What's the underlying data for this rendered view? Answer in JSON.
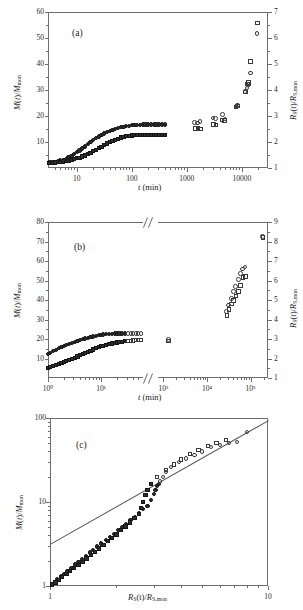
{
  "figure": {
    "panels": [
      {
        "tag": "(a)",
        "xlabel": "t (min)",
        "ylabel_left": "M(t)/Mmon",
        "ylabel_right": "RS(t)/RS,mon",
        "xticks": [
          "10",
          "100",
          "1000",
          "10000"
        ],
        "yticks_left": [
          "10",
          "20",
          "30",
          "40",
          "50",
          "60"
        ],
        "yticks_right": [
          "1",
          "2",
          "3",
          "4",
          "5",
          "6",
          "7"
        ]
      },
      {
        "tag": "(b)",
        "xlabel": "t (min)",
        "ylabel_left": "M(t)/Mmon",
        "ylabel_right": "RS(t)/RS,mon",
        "xticks": [
          "10⁰",
          "10¹",
          "10³",
          "10⁴",
          "10⁵"
        ],
        "yticks_left": [
          "10",
          "20",
          "30",
          "40",
          "50",
          "60",
          "70",
          "80"
        ],
        "yticks_right": [
          "1",
          "2",
          "3",
          "4",
          "5",
          "6",
          "7",
          "8",
          "9"
        ]
      },
      {
        "tag": "(c)",
        "xlabel": "RS(t)/RS,mon",
        "ylabel_left": "M(t)/Mmon",
        "xticks": [
          "1",
          "10"
        ],
        "yticks_left": [
          "1",
          "10",
          "100"
        ]
      }
    ]
  },
  "chart_data": [
    {
      "type": "scatter",
      "title": "(a)",
      "xlabel": "t (min)",
      "ylabel": "M(t)/M_mon",
      "ylabel_right": "R_S(t)/R_S,mon",
      "xscale": "log",
      "xlim": [
        3,
        30000
      ],
      "ylim": [
        0,
        60
      ],
      "ylim_right": [
        1,
        7
      ],
      "grid": false,
      "series": [
        {
          "name": "M(t)/M_mon (circles)",
          "marker": "circle",
          "axis": "left",
          "x": [
            3.2,
            3.6,
            4.0,
            4.5,
            5.0,
            5.6,
            6.3,
            7.1,
            8.0,
            9.0,
            10,
            11.2,
            12.6,
            14.1,
            15.8,
            17.8,
            20,
            22.4,
            25.1,
            28.2,
            31.6,
            35.5,
            39.8,
            44.7,
            50.1,
            56.2,
            63.1,
            70.8,
            79.4,
            89.1,
            100,
            112,
            126,
            141,
            158,
            178,
            200,
            224,
            251,
            282,
            316,
            355,
            398
          ],
          "y": [
            2.1,
            2.2,
            2.4,
            2.6,
            2.9,
            3.2,
            3.6,
            4.1,
            4.7,
            5.3,
            6.0,
            6.7,
            7.5,
            8.3,
            9.1,
            9.9,
            10.7,
            11.4,
            12.1,
            12.7,
            13.3,
            13.8,
            14.3,
            14.7,
            15.1,
            15.4,
            15.7,
            15.9,
            16.1,
            16.3,
            16.4,
            16.5,
            16.6,
            16.6,
            16.7,
            16.7,
            16.7,
            16.7,
            16.7,
            16.7,
            16.7,
            16.7,
            16.7
          ]
        },
        {
          "name": "R_S(t)/R_S,mon (squares)",
          "marker": "square",
          "axis": "left",
          "x": [
            3.2,
            3.6,
            4.0,
            4.5,
            5.0,
            5.6,
            6.3,
            7.1,
            8.0,
            9.0,
            10,
            11.2,
            12.6,
            14.1,
            15.8,
            17.8,
            20,
            22.4,
            25.1,
            28.2,
            31.6,
            35.5,
            39.8,
            44.7,
            50.1,
            56.2,
            63.1,
            70.8,
            79.4,
            89.1,
            100,
            112,
            126,
            141,
            158,
            178,
            200,
            224,
            251,
            282,
            316,
            355,
            398
          ],
          "y": [
            1.9,
            2.0,
            2.1,
            2.2,
            2.3,
            2.5,
            2.7,
            2.9,
            3.1,
            3.4,
            3.7,
            4.0,
            4.4,
            4.8,
            5.3,
            5.8,
            6.4,
            7.0,
            7.6,
            8.2,
            8.8,
            9.4,
            9.9,
            10.4,
            10.9,
            11.3,
            11.7,
            12.0,
            12.2,
            12.4,
            12.5,
            12.6,
            12.7,
            12.7,
            12.7,
            12.7,
            12.7,
            12.7,
            12.7,
            12.7,
            12.7,
            12.7,
            12.7
          ]
        },
        {
          "name": "long-time circles",
          "marker": "circle",
          "axis": "left",
          "x": [
            1400,
            1550,
            1750,
            3000,
            3300,
            4500,
            5000,
            7800,
            8300,
            11500,
            12500,
            13500,
            14500,
            19000
          ],
          "y": [
            17.5,
            17.3,
            17.8,
            19.2,
            19.0,
            20.6,
            18.8,
            23.8,
            24.2,
            29.5,
            30.8,
            32.2,
            36.5,
            51.8
          ]
        },
        {
          "name": "long-time squares",
          "marker": "square",
          "axis": "left",
          "x": [
            1450,
            1600,
            1800,
            3050,
            3400,
            4400,
            4900,
            7900,
            8400,
            11600,
            12600,
            13400,
            14400,
            19200
          ],
          "y": [
            15.3,
            15.1,
            15.0,
            16.8,
            16.6,
            18.5,
            18.3,
            23.5,
            23.9,
            29.2,
            32.3,
            32.8,
            41.0,
            55.8
          ]
        }
      ]
    },
    {
      "type": "scatter",
      "title": "(b)",
      "xlabel": "t (min)",
      "ylabel": "M(t)/M_mon",
      "ylabel_right": "R_S(t)/R_S,mon",
      "xscale": "log",
      "axis_break": true,
      "xlim_left": [
        1,
        60
      ],
      "xlim_right": [
        800,
        250000
      ],
      "ylim": [
        0,
        80
      ],
      "ylim_right": [
        1,
        9
      ],
      "grid": false,
      "series": [
        {
          "name": "circles (short time)",
          "marker": "circle",
          "x": [
            1.0,
            1.1,
            1.25,
            1.4,
            1.6,
            1.8,
            2.0,
            2.2,
            2.5,
            2.8,
            3.2,
            3.6,
            4.0,
            4.5,
            5.0,
            5.6,
            6.3,
            7.1,
            8.0,
            9.0,
            10,
            11,
            12.5,
            14,
            16,
            18,
            20,
            22,
            25,
            28,
            32,
            36,
            40,
            45,
            50,
            56
          ],
          "y": [
            12.3,
            13.0,
            13.8,
            14.5,
            15.2,
            15.8,
            16.4,
            16.9,
            17.5,
            18.0,
            18.5,
            19.0,
            19.5,
            19.9,
            20.3,
            20.7,
            21.0,
            21.3,
            21.6,
            21.9,
            22.1,
            22.3,
            22.5,
            22.6,
            22.7,
            22.8,
            22.8,
            22.8,
            22.8,
            22.8,
            22.8,
            22.8,
            22.8,
            22.8,
            22.8,
            22.8
          ]
        },
        {
          "name": "squares (short time)",
          "marker": "square",
          "x": [
            1.0,
            1.1,
            1.25,
            1.4,
            1.6,
            1.8,
            2.0,
            2.2,
            2.5,
            2.8,
            3.2,
            3.6,
            4.0,
            4.5,
            5.0,
            5.6,
            6.3,
            7.1,
            8.0,
            9.0,
            10,
            11,
            12.5,
            14,
            16,
            18,
            20,
            22,
            25,
            28,
            32,
            36,
            40,
            45,
            50,
            56
          ],
          "y": [
            5.2,
            5.6,
            6.1,
            6.6,
            7.1,
            7.6,
            8.1,
            8.6,
            9.2,
            9.8,
            10.4,
            11.0,
            11.6,
            12.2,
            12.8,
            13.4,
            14.0,
            14.6,
            15.2,
            15.7,
            16.2,
            16.6,
            17.0,
            17.4,
            17.7,
            18.0,
            18.2,
            18.4,
            18.6,
            18.8,
            19.0,
            19.1,
            19.2,
            19.3,
            19.4,
            19.4
          ]
        },
        {
          "name": "circles (long time)",
          "marker": "circle",
          "x": [
            1300,
            28000,
            31000,
            36000,
            40000,
            45000,
            52000,
            58000,
            66000,
            75000,
            190000
          ],
          "y": [
            19.8,
            34.2,
            37.5,
            40.8,
            44.5,
            47.0,
            50.5,
            53.5,
            55.8,
            57.0,
            72.5
          ]
        },
        {
          "name": "squares (long time)",
          "marker": "square",
          "x": [
            1320,
            29000,
            32000,
            37000,
            41000,
            46000,
            53000,
            59000,
            67000,
            76000,
            192000
          ],
          "y": [
            18.9,
            32.2,
            35.0,
            38.0,
            39.8,
            42.0,
            44.5,
            47.5,
            51.5,
            52.0,
            72.2
          ]
        }
      ]
    },
    {
      "type": "scatter",
      "title": "(c)",
      "xlabel": "R_S(t)/R_S,mon",
      "ylabel": "M(t)/M_mon",
      "xscale": "log",
      "yscale": "log",
      "xlim": [
        1,
        10
      ],
      "ylim": [
        1,
        100
      ],
      "grid": false,
      "reference_line": {
        "slope": 1.35,
        "note": "straight line through data on log-log axes"
      },
      "series": [
        {
          "name": "circles",
          "marker": "circle",
          "x": [
            1.02,
            1.05,
            1.08,
            1.12,
            1.16,
            1.2,
            1.25,
            1.3,
            1.35,
            1.4,
            1.46,
            1.52,
            1.58,
            1.65,
            1.72,
            1.8,
            1.88,
            1.96,
            2.05,
            2.14,
            2.24,
            2.34,
            2.45,
            2.56,
            2.68,
            2.8,
            2.9,
            3.0,
            3.05,
            3.1,
            3.15,
            3.2,
            3.3,
            3.4,
            3.6,
            3.9,
            4.2,
            4.6,
            5.0,
            5.5,
            6.0,
            6.6,
            7.2,
            8.0
          ],
          "y": [
            1.05,
            1.12,
            1.2,
            1.3,
            1.4,
            1.5,
            1.65,
            1.8,
            1.95,
            2.1,
            2.3,
            2.5,
            2.7,
            2.95,
            3.2,
            3.5,
            3.8,
            4.2,
            4.6,
            5.0,
            5.5,
            6.1,
            6.7,
            7.4,
            8.2,
            9.0,
            10.5,
            12.5,
            14.0,
            15.5,
            16.5,
            17.5,
            20.0,
            23.0,
            26.0,
            30.0,
            33.0,
            36.0,
            40.0,
            45.0,
            48.0,
            50.0,
            52.0,
            68.0
          ]
        },
        {
          "name": "squares",
          "marker": "square",
          "x": [
            1.02,
            1.06,
            1.1,
            1.14,
            1.19,
            1.24,
            1.29,
            1.35,
            1.41,
            1.47,
            1.54,
            1.61,
            1.68,
            1.76,
            1.84,
            1.93,
            2.02,
            2.12,
            2.22,
            2.33,
            2.44,
            2.56,
            2.62,
            2.68,
            2.74,
            2.8,
            2.9,
            3.1,
            3.4,
            3.7,
            4.0,
            4.4,
            4.8,
            5.3,
            5.8,
            6.4
          ],
          "y": [
            1.04,
            1.1,
            1.18,
            1.28,
            1.38,
            1.5,
            1.63,
            1.78,
            1.95,
            2.12,
            2.32,
            2.55,
            2.8,
            3.1,
            3.4,
            3.75,
            4.1,
            4.6,
            5.1,
            5.7,
            6.4,
            7.2,
            8.5,
            10.0,
            12.0,
            14.0,
            16.5,
            20.0,
            24.0,
            28.0,
            32.0,
            37.0,
            42.0,
            46.0,
            50.0,
            55.0
          ]
        }
      ]
    }
  ]
}
